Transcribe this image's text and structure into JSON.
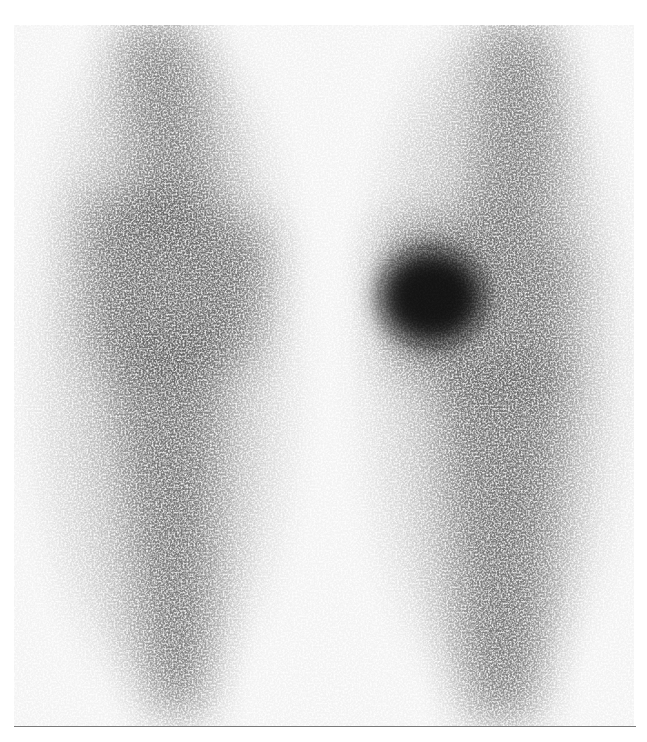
{
  "image": {
    "kind": "bone scintigraphy (knees, anterior view)",
    "background_color": "#f3f3f3",
    "ink_color": "#1a1a1a",
    "regions": [
      {
        "name": "left-femur",
        "intensity": "moderate"
      },
      {
        "name": "left-knee",
        "intensity": "moderate"
      },
      {
        "name": "left-tibia",
        "intensity": "moderate"
      },
      {
        "name": "right-femur",
        "intensity": "moderate"
      },
      {
        "name": "right-knee-hotspot",
        "intensity": "high"
      },
      {
        "name": "right-tibia",
        "intensity": "moderate"
      }
    ]
  }
}
